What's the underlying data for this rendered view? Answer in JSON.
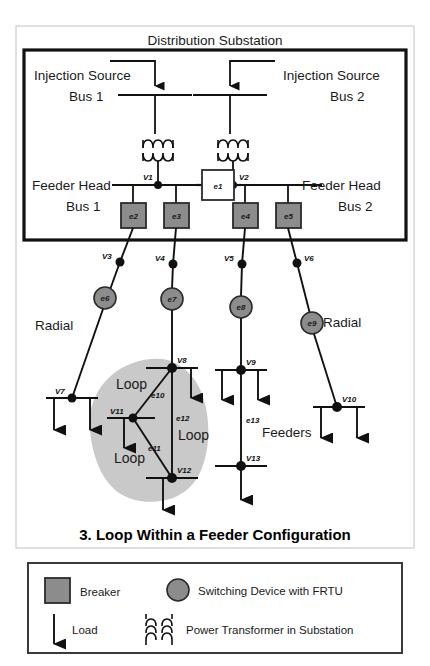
{
  "title": "3. Loop Within a Feeder Configuration",
  "substation": {
    "header": "Distribution Substation",
    "injection_source_1_line1": "Injection Source",
    "injection_source_1_line2": "Bus 1",
    "injection_source_2_line1": "Injection Source",
    "injection_source_2_line2": "Bus 2",
    "feeder_head_1_line1": "Feeder Head",
    "feeder_head_1_line2": "Bus 1",
    "feeder_head_2_line1": "Feeder Head",
    "feeder_head_2_line2": "Bus 2"
  },
  "annotations": {
    "radial_left": "Radial",
    "radial_right": "Radial",
    "feeders": "Feeders",
    "loop_a": "Loop",
    "loop_b": "Loop",
    "loop_c": "Loop"
  },
  "nodes": {
    "v1": "V1",
    "v2": "V2",
    "v3": "V3",
    "v4": "V4",
    "v5": "V5",
    "v6": "V6",
    "v7": "V7",
    "v8": "V8",
    "v9": "V9",
    "v10": "V10",
    "v11": "V11",
    "v12": "V12",
    "v13": "V13"
  },
  "devices": {
    "e1": "e1",
    "e2": "e2",
    "e3": "e3",
    "e4": "e4",
    "e5": "e5",
    "e6": "e6",
    "e7": "e7",
    "e8": "e8",
    "e9": "e9"
  },
  "edges": {
    "e10": "e10",
    "e11": "e11",
    "e12": "e12",
    "e13": "e13"
  },
  "legend": {
    "breaker": "Breaker",
    "switching_device": "Switching Device with FRTU",
    "load": "Load",
    "transformer": "Power Transformer in Substation"
  },
  "colors": {
    "device_fill": "#8c8c8c",
    "device_stroke": "#2b2b2b",
    "tie_fill": "#ffffff",
    "loop_region": "#c9c9c9",
    "line": "#1a1a1a",
    "frame": "#d0d0d0"
  }
}
